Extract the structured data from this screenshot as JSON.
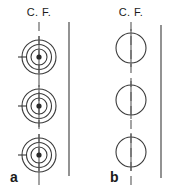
{
  "figure": {
    "background_color": "#ffffff",
    "line_color": "#3a3a3a",
    "centerline_color": "#5a5a5a",
    "label_color": "#1a1a1a",
    "width": 171,
    "height": 193
  },
  "panels": [
    {
      "id": "a",
      "label": "a",
      "label_x": 10,
      "label_y": 182,
      "centerline_label": "C. F.",
      "centerline_label_x": 39,
      "centerline_label_y": 16,
      "centerline": {
        "x": 39,
        "y_top": 22,
        "y_bottom": 190,
        "style": "dashed"
      },
      "reference_line": {
        "x": 69,
        "y_top": 22,
        "y_bottom": 176,
        "style": "solid"
      },
      "elements": [
        {
          "name": "concentric-ring-assembly",
          "cx": 39,
          "cy": 57,
          "radii": [
            17,
            12.5,
            8
          ],
          "core_radius": 2.6,
          "tick": {
            "x1": 18,
            "x2": 26,
            "y": 57
          }
        },
        {
          "name": "concentric-ring-assembly",
          "cx": 39,
          "cy": 106,
          "radii": [
            17,
            12.5,
            8
          ],
          "core_radius": 2.6,
          "tick": {
            "x1": 18,
            "x2": 26,
            "y": 106
          }
        },
        {
          "name": "concentric-ring-assembly",
          "cx": 39,
          "cy": 155,
          "radii": [
            17,
            12.5,
            8
          ],
          "core_radius": 2.6,
          "tick": {
            "x1": 18,
            "x2": 26,
            "y": 155
          }
        }
      ]
    },
    {
      "id": "b",
      "label": "b",
      "label_x": 110,
      "label_y": 182,
      "centerline_label": "C. F.",
      "centerline_label_x": 131,
      "centerline_label_y": 16,
      "centerline": {
        "x": 131,
        "y_top": 22,
        "y_bottom": 190,
        "style": "dashed"
      },
      "reference_line": {
        "x": 161,
        "y_top": 25,
        "y_bottom": 178,
        "style": "solid"
      },
      "elements": [
        {
          "name": "single-circle",
          "cx": 131,
          "cy": 48,
          "radii": [
            15
          ],
          "core_radius": 0,
          "tick": null
        },
        {
          "name": "single-circle",
          "cx": 131,
          "cy": 100,
          "radii": [
            15
          ],
          "core_radius": 0,
          "tick": null
        },
        {
          "name": "single-circle",
          "cx": 131,
          "cy": 152,
          "radii": [
            15
          ],
          "core_radius": 0,
          "tick": null
        }
      ]
    }
  ]
}
